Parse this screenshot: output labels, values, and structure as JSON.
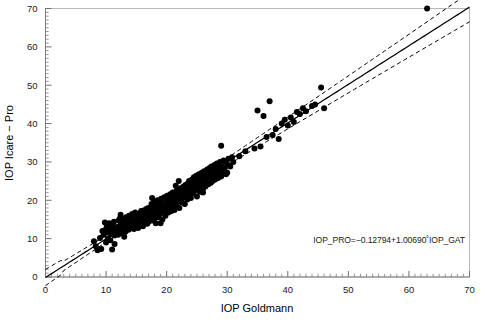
{
  "chart_data": {
    "type": "scatter",
    "title": "",
    "xlabel": "IOP Goldmann",
    "ylabel": "IOP Icare − Pro",
    "xlim": [
      0,
      70
    ],
    "ylim": [
      0,
      70
    ],
    "xticks": [
      0,
      10,
      20,
      30,
      40,
      50,
      60,
      70
    ],
    "yticks": [
      0,
      10,
      20,
      30,
      40,
      50,
      60,
      70
    ],
    "xticklabels": [
      "0",
      "10",
      "20",
      "30",
      "40",
      "50",
      "60",
      "70"
    ],
    "yticklabels": [
      "0",
      "10",
      "20",
      "30",
      "40",
      "50",
      "60",
      "70"
    ],
    "minor_tick_step": 1,
    "grid": false,
    "legend": "none",
    "annotation": "IOP_PRO=−0.12794+1.00690˚IOP_GAT",
    "regression": {
      "intercept": -0.12794,
      "slope": 1.0069,
      "style": "solid",
      "confidence_band": {
        "style": "dashed",
        "half_width_at_x0": 1.15,
        "half_width_min": 0.55,
        "x_min_width": 19.0
      }
    },
    "marker": {
      "shape": "circle",
      "color": "#000000",
      "radius": 3.0
    },
    "n_points": 259,
    "points": [
      [
        8.0,
        9.3
      ],
      [
        8.3,
        8.0
      ],
      [
        8.6,
        7.0
      ],
      [
        9.0,
        10.2
      ],
      [
        9.2,
        7.3
      ],
      [
        9.4,
        12.0
      ],
      [
        9.6,
        11.0
      ],
      [
        9.8,
        14.2
      ],
      [
        10.0,
        12.4
      ],
      [
        10.0,
        9.0
      ],
      [
        10.1,
        13.0
      ],
      [
        10.2,
        11.6
      ],
      [
        10.3,
        10.0
      ],
      [
        10.4,
        12.8
      ],
      [
        10.5,
        14.0
      ],
      [
        10.6,
        13.3
      ],
      [
        10.7,
        9.6
      ],
      [
        10.8,
        11.2
      ],
      [
        10.9,
        12.1
      ],
      [
        11.0,
        7.2
      ],
      [
        11.0,
        13.6
      ],
      [
        11.2,
        12.5
      ],
      [
        11.3,
        14.4
      ],
      [
        11.4,
        10.8
      ],
      [
        11.5,
        13.0
      ],
      [
        11.6,
        11.9
      ],
      [
        11.8,
        12.7
      ],
      [
        12.0,
        13.1
      ],
      [
        12.0,
        11.0
      ],
      [
        12.1,
        14.8
      ],
      [
        12.2,
        12.2
      ],
      [
        12.3,
        15.3
      ],
      [
        12.4,
        13.7
      ],
      [
        12.5,
        12.0
      ],
      [
        12.6,
        14.1
      ],
      [
        12.7,
        11.5
      ],
      [
        12.8,
        13.4
      ],
      [
        12.9,
        15.0
      ],
      [
        13.0,
        12.6
      ],
      [
        13.0,
        14.6
      ],
      [
        13.1,
        13.0
      ],
      [
        13.2,
        11.8
      ],
      [
        13.3,
        15.6
      ],
      [
        13.4,
        12.9
      ],
      [
        13.5,
        14.2
      ],
      [
        13.6,
        13.5
      ],
      [
        13.7,
        12.3
      ],
      [
        13.8,
        16.0
      ],
      [
        13.9,
        14.9
      ],
      [
        14.0,
        13.2
      ],
      [
        14.0,
        15.4
      ],
      [
        14.1,
        12.7
      ],
      [
        14.2,
        14.0
      ],
      [
        14.3,
        16.4
      ],
      [
        14.4,
        13.8
      ],
      [
        14.5,
        15.1
      ],
      [
        14.6,
        12.5
      ],
      [
        14.7,
        14.5
      ],
      [
        14.8,
        16.8
      ],
      [
        14.9,
        13.6
      ],
      [
        15.0,
        15.0
      ],
      [
        15.0,
        13.0
      ],
      [
        15.1,
        16.2
      ],
      [
        15.2,
        14.3
      ],
      [
        15.3,
        12.8
      ],
      [
        15.4,
        15.8
      ],
      [
        15.5,
        14.0
      ],
      [
        15.6,
        16.6
      ],
      [
        15.7,
        13.4
      ],
      [
        15.8,
        15.2
      ],
      [
        15.9,
        17.0
      ],
      [
        16.0,
        14.6
      ],
      [
        16.0,
        16.0
      ],
      [
        16.1,
        13.2
      ],
      [
        16.2,
        15.5
      ],
      [
        16.3,
        17.4
      ],
      [
        16.4,
        14.2
      ],
      [
        16.5,
        16.3
      ],
      [
        16.6,
        15.0
      ],
      [
        16.7,
        17.8
      ],
      [
        16.8,
        13.9
      ],
      [
        16.9,
        16.8
      ],
      [
        17.0,
        15.4
      ],
      [
        17.0,
        18.0
      ],
      [
        17.1,
        14.5
      ],
      [
        17.2,
        16.1
      ],
      [
        17.3,
        17.2
      ],
      [
        17.4,
        15.8
      ],
      [
        17.5,
        19.0
      ],
      [
        17.6,
        16.5
      ],
      [
        17.7,
        14.8
      ],
      [
        17.8,
        18.4
      ],
      [
        17.9,
        17.0
      ],
      [
        18.0,
        15.2
      ],
      [
        18.0,
        16.9
      ],
      [
        18.0,
        19.6
      ],
      [
        18.1,
        18.0
      ],
      [
        18.2,
        14.0
      ],
      [
        18.3,
        17.5
      ],
      [
        18.4,
        16.2
      ],
      [
        18.5,
        20.0
      ],
      [
        18.6,
        18.7
      ],
      [
        18.7,
        15.6
      ],
      [
        18.8,
        17.1
      ],
      [
        18.9,
        19.2
      ],
      [
        19.0,
        16.6
      ],
      [
        19.0,
        18.2
      ],
      [
        19.1,
        20.4
      ],
      [
        19.2,
        17.8
      ],
      [
        19.3,
        15.0
      ],
      [
        19.4,
        19.0
      ],
      [
        19.5,
        17.3
      ],
      [
        19.6,
        20.8
      ],
      [
        19.7,
        18.5
      ],
      [
        19.8,
        16.0
      ],
      [
        19.9,
        19.5
      ],
      [
        20.0,
        17.6
      ],
      [
        20.0,
        20.0
      ],
      [
        20.0,
        18.8
      ],
      [
        20.1,
        21.2
      ],
      [
        20.2,
        19.2
      ],
      [
        20.3,
        16.8
      ],
      [
        20.4,
        20.6
      ],
      [
        20.5,
        18.1
      ],
      [
        20.6,
        21.6
      ],
      [
        20.7,
        19.8
      ],
      [
        20.8,
        17.2
      ],
      [
        20.9,
        20.2
      ],
      [
        21.0,
        18.6
      ],
      [
        21.0,
        22.0
      ],
      [
        21.1,
        20.9
      ],
      [
        21.2,
        19.0
      ],
      [
        21.3,
        17.5
      ],
      [
        21.4,
        21.4
      ],
      [
        21.5,
        20.0
      ],
      [
        21.6,
        22.4
      ],
      [
        21.7,
        18.3
      ],
      [
        21.8,
        21.0
      ],
      [
        21.9,
        19.6
      ],
      [
        22.0,
        20.4
      ],
      [
        22.0,
        22.8
      ],
      [
        22.1,
        18.0
      ],
      [
        22.2,
        21.8
      ],
      [
        22.3,
        20.1
      ],
      [
        22.4,
        23.2
      ],
      [
        22.5,
        19.4
      ],
      [
        22.6,
        22.2
      ],
      [
        22.7,
        20.8
      ],
      [
        22.8,
        23.6
      ],
      [
        22.9,
        21.3
      ],
      [
        23.0,
        19.0
      ],
      [
        23.0,
        22.6
      ],
      [
        23.1,
        24.0
      ],
      [
        23.2,
        21.0
      ],
      [
        23.3,
        23.0
      ],
      [
        23.4,
        20.2
      ],
      [
        23.5,
        24.4
      ],
      [
        23.6,
        22.0
      ],
      [
        23.7,
        25.0
      ],
      [
        23.8,
        21.5
      ],
      [
        23.9,
        23.4
      ],
      [
        24.0,
        20.6
      ],
      [
        24.0,
        24.8
      ],
      [
        24.1,
        22.9
      ],
      [
        24.2,
        25.4
      ],
      [
        24.3,
        21.8
      ],
      [
        24.4,
        23.8
      ],
      [
        24.5,
        26.0
      ],
      [
        24.6,
        22.4
      ],
      [
        24.7,
        25.0
      ],
      [
        24.8,
        23.0
      ],
      [
        24.9,
        26.4
      ],
      [
        25.0,
        24.2
      ],
      [
        25.0,
        21.0
      ],
      [
        25.1,
        25.8
      ],
      [
        25.2,
        23.5
      ],
      [
        25.3,
        26.8
      ],
      [
        25.4,
        24.6
      ],
      [
        25.5,
        22.2
      ],
      [
        25.6,
        26.0
      ],
      [
        25.7,
        24.0
      ],
      [
        25.8,
        27.2
      ],
      [
        25.9,
        25.2
      ],
      [
        26.0,
        23.0
      ],
      [
        26.0,
        26.6
      ],
      [
        26.1,
        24.8
      ],
      [
        26.2,
        27.6
      ],
      [
        26.3,
        25.6
      ],
      [
        26.4,
        23.6
      ],
      [
        26.5,
        27.0
      ],
      [
        26.6,
        25.0
      ],
      [
        26.7,
        28.0
      ],
      [
        26.8,
        26.2
      ],
      [
        26.9,
        24.2
      ],
      [
        27.0,
        27.4
      ],
      [
        27.0,
        25.4
      ],
      [
        27.1,
        28.4
      ],
      [
        27.2,
        26.0
      ],
      [
        27.3,
        24.6
      ],
      [
        27.4,
        28.8
      ],
      [
        27.5,
        26.8
      ],
      [
        27.6,
        25.0
      ],
      [
        27.7,
        27.8
      ],
      [
        27.8,
        26.4
      ],
      [
        27.9,
        29.2
      ],
      [
        28.0,
        27.0
      ],
      [
        28.0,
        25.4
      ],
      [
        28.1,
        28.2
      ],
      [
        28.2,
        26.8
      ],
      [
        28.3,
        29.6
      ],
      [
        28.4,
        27.4
      ],
      [
        28.5,
        25.8
      ],
      [
        28.6,
        28.6
      ],
      [
        28.7,
        27.0
      ],
      [
        28.8,
        30.0
      ],
      [
        28.9,
        28.0
      ],
      [
        29.0,
        26.2
      ],
      [
        29.0,
        29.0
      ],
      [
        29.2,
        27.5
      ],
      [
        29.4,
        30.4
      ],
      [
        29.6,
        28.4
      ],
      [
        29.8,
        26.8
      ],
      [
        30.0,
        29.4
      ],
      [
        30.0,
        27.2
      ],
      [
        30.2,
        30.8
      ],
      [
        30.5,
        28.8
      ],
      [
        30.8,
        31.2
      ],
      [
        29.0,
        34.2
      ],
      [
        21.5,
        23.8
      ],
      [
        17.6,
        20.6
      ],
      [
        15.8,
        17.2
      ],
      [
        19.0,
        14.0
      ],
      [
        22.0,
        25.0
      ],
      [
        26.0,
        22.0
      ],
      [
        12.4,
        16.2
      ],
      [
        13.0,
        10.5
      ],
      [
        11.4,
        8.6
      ],
      [
        31.0,
        30.0
      ],
      [
        32.0,
        31.5
      ],
      [
        33.0,
        32.8
      ],
      [
        34.5,
        33.5
      ],
      [
        35.0,
        43.4
      ],
      [
        35.5,
        34.0
      ],
      [
        36.0,
        42.0
      ],
      [
        36.5,
        36.5
      ],
      [
        37.0,
        45.8
      ],
      [
        37.5,
        37.0
      ],
      [
        38.0,
        38.6
      ],
      [
        38.5,
        36.0
      ],
      [
        39.0,
        40.0
      ],
      [
        39.5,
        41.0
      ],
      [
        40.0,
        39.5
      ],
      [
        40.5,
        41.6
      ],
      [
        41.0,
        40.4
      ],
      [
        41.5,
        43.0
      ],
      [
        42.0,
        42.5
      ],
      [
        42.5,
        44.0
      ],
      [
        43.0,
        43.2
      ],
      [
        44.0,
        44.6
      ],
      [
        44.5,
        45.0
      ],
      [
        45.5,
        49.4
      ],
      [
        46.0,
        44.0
      ],
      [
        63.0,
        70.0
      ]
    ]
  }
}
